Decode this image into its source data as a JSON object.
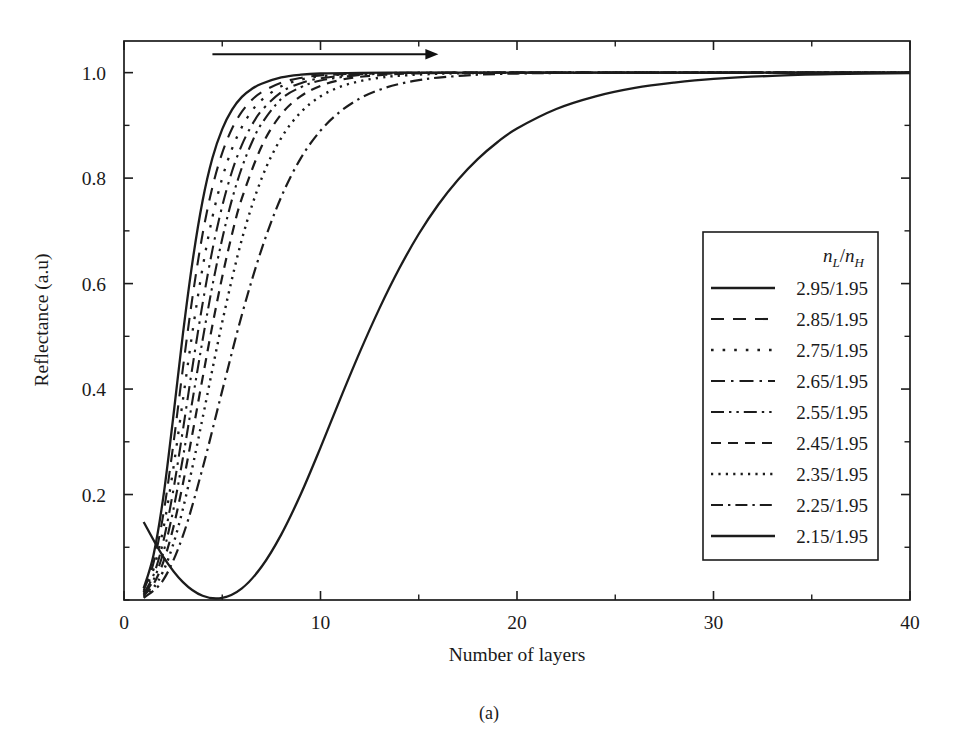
{
  "figure": {
    "caption": "(a)",
    "background_color": "#ffffff",
    "ink_color": "#1c1c1c"
  },
  "chart_data": {
    "type": "line",
    "title": "",
    "subtitle": "",
    "xlabel": "Number of layers",
    "ylabel": "Reflectance (a.u)",
    "xlim": [
      0,
      40
    ],
    "ylim": [
      0,
      1.06
    ],
    "xticks": [
      0,
      10,
      20,
      30,
      40
    ],
    "xtick_labels": [
      "0",
      "10",
      "20",
      "30",
      "40"
    ],
    "xticks_minor": [
      5,
      15,
      25,
      35
    ],
    "yticks": [
      0.2,
      0.4,
      0.6,
      0.8,
      1.0
    ],
    "ytick_labels": [
      "0.2",
      "0.4",
      "0.6",
      "0.8",
      "1.0"
    ],
    "yticks_minor": [
      0.1,
      0.3,
      0.5,
      0.7,
      0.9
    ],
    "grid": false,
    "tick_direction": "in",
    "frame": "box",
    "legend_position": "lower right",
    "legend_title": "nL/nH",
    "legend_title_parts": {
      "n1": "n",
      "sub1": "L",
      "slash": "/",
      "n2": "n",
      "sub2": "H"
    },
    "annotations": [
      {
        "name": "trend-arrow",
        "type": "arrow",
        "text": "",
        "x_start": 4.5,
        "x_end": 16.0,
        "y": 1.035,
        "direction": "right"
      }
    ],
    "series": [
      {
        "name": "2.95/1.95",
        "label": "2.95/1.95",
        "dash": "solid",
        "dasharray": "",
        "width": 2.3,
        "x": [
          1,
          1.5,
          2,
          2.5,
          3,
          3.5,
          4,
          4.5,
          5,
          5.5,
          6,
          6.5,
          7,
          8,
          9,
          10,
          12,
          14,
          16,
          20,
          25,
          30,
          35,
          40
        ],
        "y": [
          0.022,
          0.085,
          0.195,
          0.345,
          0.505,
          0.645,
          0.757,
          0.838,
          0.893,
          0.93,
          0.954,
          0.969,
          0.979,
          0.991,
          0.9962,
          0.9984,
          0.9996,
          0.9999,
          1.0,
          1.0,
          1.0,
          1.0,
          1.0,
          1.0
        ]
      },
      {
        "name": "2.85/1.95",
        "label": "2.85/1.95",
        "dash": "dashed-long",
        "dasharray": "13 9",
        "width": 2.1,
        "x": [
          1,
          1.5,
          2,
          2.5,
          3,
          3.5,
          4,
          4.5,
          5,
          5.5,
          6,
          6.5,
          7,
          8,
          9,
          10,
          12,
          14,
          16,
          20,
          25,
          30,
          35,
          40
        ],
        "y": [
          0.018,
          0.07,
          0.162,
          0.292,
          0.44,
          0.578,
          0.694,
          0.783,
          0.848,
          0.894,
          0.926,
          0.948,
          0.963,
          0.981,
          0.99,
          0.9948,
          0.9985,
          0.9996,
          0.9999,
          1.0,
          1.0,
          1.0,
          1.0,
          1.0
        ]
      },
      {
        "name": "2.75/1.95",
        "label": "2.75/1.95",
        "dash": "dotted-wide",
        "dasharray": "2.6 9",
        "width": 2.3,
        "x": [
          1,
          1.5,
          2,
          2.5,
          3,
          3.5,
          4,
          4.5,
          5,
          5.5,
          6,
          6.5,
          7,
          8,
          9,
          10,
          12,
          14,
          16,
          20,
          25,
          30,
          35,
          40
        ],
        "y": [
          0.015,
          0.058,
          0.135,
          0.247,
          0.38,
          0.512,
          0.63,
          0.726,
          0.8,
          0.856,
          0.897,
          0.927,
          0.948,
          0.974,
          0.9867,
          0.9932,
          0.9982,
          0.9995,
          0.9999,
          1.0,
          1.0,
          1.0,
          1.0,
          1.0
        ]
      },
      {
        "name": "2.65/1.95",
        "label": "2.65/1.95",
        "dash": "dash-dot-long",
        "dasharray": "14 6 2.5 6",
        "width": 2.1,
        "x": [
          1,
          1.5,
          2,
          2.5,
          3,
          3.5,
          4,
          4.5,
          5,
          5.5,
          6,
          6.5,
          7,
          8,
          9,
          10,
          12,
          14,
          16,
          20,
          25,
          30,
          35,
          40
        ],
        "y": [
          0.012,
          0.047,
          0.111,
          0.206,
          0.323,
          0.446,
          0.562,
          0.664,
          0.747,
          0.813,
          0.863,
          0.9,
          0.928,
          0.963,
          0.98,
          0.9893,
          0.9971,
          0.9992,
          0.9998,
          1.0,
          1.0,
          1.0,
          1.0,
          1.0
        ]
      },
      {
        "name": "2.55/1.95",
        "label": "2.55/1.95",
        "dash": "dash-dot-dot",
        "dasharray": "13 5 2.4 5 2.4 5",
        "width": 2.1,
        "x": [
          1,
          1.5,
          2,
          2.5,
          3,
          3.5,
          4,
          4.5,
          5,
          5.5,
          6,
          6.5,
          7,
          8,
          9,
          10,
          12,
          14,
          16,
          20,
          25,
          30,
          35,
          40
        ],
        "y": [
          0.01,
          0.038,
          0.09,
          0.169,
          0.27,
          0.382,
          0.493,
          0.596,
          0.685,
          0.76,
          0.82,
          0.867,
          0.903,
          0.95,
          0.9724,
          0.985,
          0.9955,
          0.9987,
          0.9996,
          1.0,
          1.0,
          1.0,
          1.0,
          1.0
        ]
      },
      {
        "name": "2.45/1.95",
        "label": "2.45/1.95",
        "dash": "dashed-medium",
        "dasharray": "10 7",
        "width": 2.2,
        "x": [
          1,
          1.5,
          2,
          2.5,
          3,
          3.5,
          4,
          4.5,
          5,
          5.5,
          6,
          7,
          8,
          9,
          10,
          11,
          12,
          14,
          16,
          18,
          20,
          25,
          30,
          35,
          40
        ],
        "y": [
          0.008,
          0.03,
          0.072,
          0.136,
          0.221,
          0.319,
          0.421,
          0.521,
          0.613,
          0.694,
          0.762,
          0.86,
          0.921,
          0.9555,
          0.975,
          0.986,
          0.9921,
          0.9975,
          0.9992,
          0.9997,
          0.9999,
          1.0,
          1.0,
          1.0,
          1.0
        ]
      },
      {
        "name": "2.35/1.95",
        "label": "2.35/1.95",
        "dash": "dotted-fine",
        "dasharray": "2.2 5.2",
        "width": 2.4,
        "x": [
          1,
          1.5,
          2,
          2.5,
          3,
          3.5,
          4,
          5,
          6,
          7,
          8,
          9,
          10,
          11,
          12,
          13,
          14,
          16,
          18,
          20,
          25,
          30,
          35,
          40
        ],
        "y": [
          0.006,
          0.023,
          0.055,
          0.105,
          0.173,
          0.255,
          0.345,
          0.527,
          0.684,
          0.799,
          0.876,
          0.925,
          0.955,
          0.9731,
          0.9838,
          0.9903,
          0.9942,
          0.9979,
          0.9993,
          0.9997,
          1.0,
          1.0,
          1.0,
          1.0
        ]
      },
      {
        "name": "2.25/1.95",
        "label": "2.25/1.95",
        "dash": "dash-dot",
        "dasharray": "12 5 2.4 5",
        "width": 2.2,
        "x": [
          1,
          2,
          3,
          4,
          5,
          6,
          7,
          8,
          9,
          10,
          11,
          12,
          13,
          14,
          15,
          16,
          18,
          20,
          22,
          25,
          30,
          35,
          40
        ],
        "y": [
          0.004,
          0.038,
          0.122,
          0.25,
          0.397,
          0.541,
          0.665,
          0.764,
          0.838,
          0.89,
          0.926,
          0.951,
          0.9675,
          0.9785,
          0.9857,
          0.9906,
          0.996,
          0.9983,
          0.9993,
          0.9998,
          1.0,
          1.0,
          1.0
        ]
      },
      {
        "name": "2.15/1.95",
        "label": "2.15/1.95",
        "dash": "solid",
        "dasharray": "",
        "width": 2.3,
        "x": [
          1,
          2,
          3,
          4,
          5,
          6,
          7,
          8,
          9,
          10,
          11,
          12,
          13,
          14,
          15,
          16,
          17,
          18,
          19,
          20,
          22,
          24,
          26,
          28,
          30,
          33,
          36,
          40
        ],
        "y": [
          0.148,
          0.082,
          0.034,
          0.008,
          0.004,
          0.022,
          0.063,
          0.124,
          0.201,
          0.289,
          0.381,
          0.47,
          0.553,
          0.628,
          0.694,
          0.75,
          0.797,
          0.836,
          0.868,
          0.894,
          0.931,
          0.955,
          0.971,
          0.981,
          0.988,
          0.994,
          0.997,
          0.999
        ]
      }
    ]
  }
}
